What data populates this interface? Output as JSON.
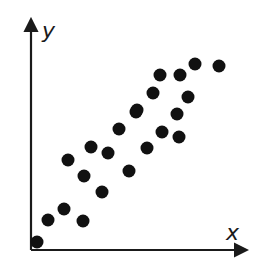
{
  "chart_data": {
    "type": "scatter",
    "title": "",
    "xlabel": "x",
    "ylabel": "y",
    "grid": false,
    "legend": null,
    "xlim": [
      0,
      21.5
    ],
    "ylim": [
      0,
      22.5
    ],
    "tick_labels": false,
    "marker_color": "#111111",
    "axis_color": "#1a1a1a",
    "points": [
      {
        "x": 0.6,
        "y": 0.8
      },
      {
        "x": 1.7,
        "y": 3.0
      },
      {
        "x": 3.3,
        "y": 4.1
      },
      {
        "x": 5.2,
        "y": 2.9
      },
      {
        "x": 3.7,
        "y": 9.0
      },
      {
        "x": 5.3,
        "y": 7.4
      },
      {
        "x": 6.0,
        "y": 10.3
      },
      {
        "x": 7.7,
        "y": 9.7
      },
      {
        "x": 7.1,
        "y": 5.8
      },
      {
        "x": 8.8,
        "y": 12.1
      },
      {
        "x": 9.8,
        "y": 7.9
      },
      {
        "x": 10.5,
        "y": 13.8
      },
      {
        "x": 11.6,
        "y": 10.2
      },
      {
        "x": 13.1,
        "y": 11.8
      },
      {
        "x": 14.8,
        "y": 11.3
      },
      {
        "x": 10.6,
        "y": 14.0
      },
      {
        "x": 12.2,
        "y": 15.7
      },
      {
        "x": 14.6,
        "y": 13.6
      },
      {
        "x": 15.7,
        "y": 15.3
      },
      {
        "x": 12.9,
        "y": 17.5
      },
      {
        "x": 14.9,
        "y": 17.5
      },
      {
        "x": 16.4,
        "y": 18.6
      },
      {
        "x": 18.8,
        "y": 18.4
      }
    ]
  },
  "labels": {
    "x_axis": "x",
    "y_axis": "y"
  }
}
